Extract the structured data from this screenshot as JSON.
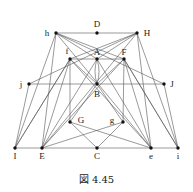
{
  "figure": {
    "caption": "図 4.45",
    "nodes": [
      {
        "id": "D",
        "x": 97,
        "y": 33,
        "lx": 97,
        "ly": 27
      },
      {
        "id": "h",
        "x": 56,
        "y": 33,
        "lx": 47,
        "ly": 36
      },
      {
        "id": "H",
        "x": 137,
        "y": 33,
        "lx": 147,
        "ly": 36
      },
      {
        "id": "f",
        "x": 70,
        "y": 59,
        "lx": 67,
        "ly": 54
      },
      {
        "id": "A",
        "x": 97,
        "y": 59,
        "lx": 97,
        "ly": 55
      },
      {
        "id": "F",
        "x": 124,
        "y": 59,
        "lx": 124,
        "ly": 55
      },
      {
        "id": "j",
        "x": 29,
        "y": 84,
        "lx": 21,
        "ly": 87
      },
      {
        "id": "B",
        "x": 97,
        "y": 84,
        "lx": 97,
        "ly": 97
      },
      {
        "id": "J",
        "x": 164,
        "y": 84,
        "lx": 172,
        "ly": 87
      },
      {
        "id": "G",
        "x": 70,
        "y": 122,
        "lx": 81,
        "ly": 123
      },
      {
        "id": "g",
        "x": 123,
        "y": 122,
        "lx": 112,
        "ly": 123
      },
      {
        "id": "I",
        "x": 15,
        "y": 148,
        "lx": 15,
        "ly": 159
      },
      {
        "id": "E",
        "x": 42,
        "y": 148,
        "lx": 42,
        "ly": 159
      },
      {
        "id": "C",
        "x": 97,
        "y": 148,
        "lx": 97,
        "ly": 159
      },
      {
        "id": "e",
        "x": 151,
        "y": 148,
        "lx": 151,
        "ly": 159
      },
      {
        "id": "i",
        "x": 178,
        "y": 148,
        "lx": 178,
        "ly": 159
      }
    ],
    "edges": [
      [
        "h",
        "D"
      ],
      [
        "D",
        "H"
      ],
      [
        "f",
        "A"
      ],
      [
        "A",
        "F"
      ],
      [
        "j",
        "B"
      ],
      [
        "B",
        "J"
      ],
      [
        "I",
        "E"
      ],
      [
        "E",
        "C"
      ],
      [
        "C",
        "e"
      ],
      [
        "e",
        "i"
      ],
      [
        "h",
        "I"
      ],
      [
        "h",
        "E"
      ],
      [
        "h",
        "F"
      ],
      [
        "h",
        "e"
      ],
      [
        "h",
        "A"
      ],
      [
        "h",
        "J"
      ],
      [
        "H",
        "i"
      ],
      [
        "H",
        "e"
      ],
      [
        "H",
        "f"
      ],
      [
        "H",
        "E"
      ],
      [
        "H",
        "A"
      ],
      [
        "H",
        "j"
      ],
      [
        "f",
        "I"
      ],
      [
        "f",
        "E"
      ],
      [
        "f",
        "G"
      ],
      [
        "f",
        "e"
      ],
      [
        "f",
        "B"
      ],
      [
        "F",
        "i"
      ],
      [
        "F",
        "e"
      ],
      [
        "F",
        "g"
      ],
      [
        "F",
        "E"
      ],
      [
        "F",
        "B"
      ],
      [
        "j",
        "I"
      ],
      [
        "J",
        "i"
      ],
      [
        "A",
        "E"
      ],
      [
        "A",
        "e"
      ],
      [
        "B",
        "G"
      ],
      [
        "B",
        "g"
      ],
      [
        "G",
        "C"
      ],
      [
        "g",
        "C"
      ],
      [
        "G",
        "e"
      ],
      [
        "g",
        "E"
      ],
      [
        "I",
        "f"
      ],
      [
        "i",
        "F"
      ]
    ]
  }
}
